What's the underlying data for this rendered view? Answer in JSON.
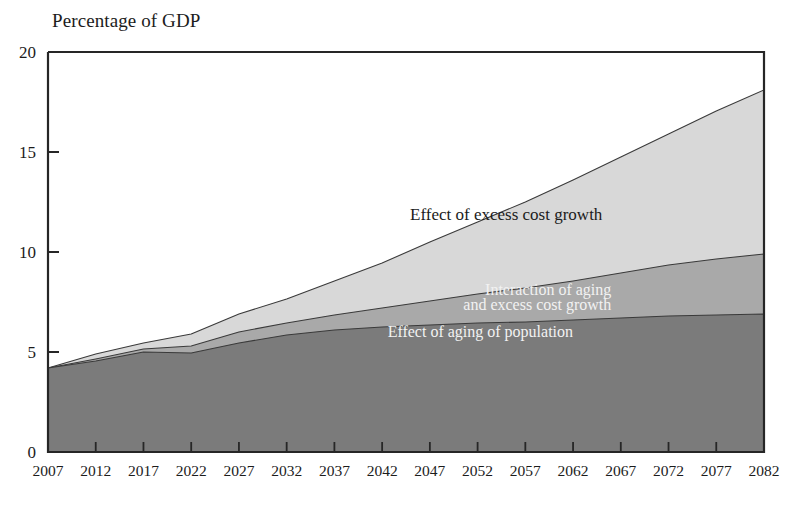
{
  "chart_data": {
    "type": "area",
    "title": "",
    "ylabel": "Percentage of GDP",
    "xlabel": "",
    "stacked": true,
    "grid": false,
    "legend_position": "inline-annotations",
    "xlim": [
      2007,
      2082
    ],
    "ylim": [
      0,
      20
    ],
    "ytick_labels": [
      "0",
      "5",
      "10",
      "15",
      "20"
    ],
    "ytick_values": [
      0,
      5,
      10,
      15,
      20
    ],
    "xtick_labels": [
      "2007",
      "2012",
      "2017",
      "2022",
      "2027",
      "2032",
      "2037",
      "2042",
      "2047",
      "2052",
      "2057",
      "2062",
      "2067",
      "2072",
      "2077",
      "2082"
    ],
    "xtick_values": [
      2007,
      2012,
      2017,
      2022,
      2027,
      2032,
      2037,
      2042,
      2047,
      2052,
      2057,
      2062,
      2067,
      2072,
      2077,
      2082
    ],
    "x": [
      2007,
      2012,
      2017,
      2022,
      2027,
      2032,
      2037,
      2042,
      2047,
      2052,
      2057,
      2062,
      2067,
      2072,
      2077,
      2082
    ],
    "series": [
      {
        "name": "Effect of aging of population",
        "color": "#7b7b7b",
        "values": [
          4.2,
          4.55,
          5.0,
          4.95,
          5.45,
          5.85,
          6.1,
          6.25,
          6.35,
          6.45,
          6.5,
          6.6,
          6.7,
          6.8,
          6.85,
          6.9
        ]
      },
      {
        "name": "Interaction of aging and excess cost growth",
        "color": "#a9a9a9",
        "values": [
          0.0,
          0.1,
          0.15,
          0.35,
          0.55,
          0.6,
          0.75,
          0.95,
          1.2,
          1.45,
          1.7,
          1.95,
          2.25,
          2.55,
          2.8,
          3.0
        ]
      },
      {
        "name": "Effect of excess cost growth",
        "color": "#d8d8d8",
        "values": [
          0.0,
          0.25,
          0.3,
          0.6,
          0.9,
          1.2,
          1.7,
          2.25,
          2.95,
          3.6,
          4.3,
          5.05,
          5.8,
          6.55,
          7.4,
          8.2
        ]
      }
    ],
    "cumulative_tops": {
      "aging": [
        4.2,
        4.55,
        5.0,
        4.95,
        5.45,
        5.85,
        6.1,
        6.25,
        6.35,
        6.45,
        6.5,
        6.6,
        6.7,
        6.8,
        6.85,
        6.9
      ],
      "aging_plus_interaction": [
        4.2,
        4.65,
        5.15,
        5.3,
        6.0,
        6.45,
        6.85,
        7.2,
        7.55,
        7.9,
        8.2,
        8.55,
        8.95,
        9.35,
        9.65,
        9.9
      ],
      "total": [
        4.2,
        4.9,
        5.45,
        5.9,
        6.9,
        7.65,
        8.55,
        9.45,
        10.5,
        11.5,
        12.5,
        13.6,
        14.75,
        15.9,
        17.05,
        18.1
      ]
    },
    "annotations": [
      {
        "text": "Effect of excess cost growth",
        "x": 2055,
        "y": 11.6,
        "color": "#1b1b1b"
      },
      {
        "text": "Interaction of aging",
        "x": 2066,
        "y": 7.85,
        "color": "#f2f2f2"
      },
      {
        "text": "and excess cost growth",
        "x": 2066,
        "y": 7.1,
        "color": "#f2f2f2"
      },
      {
        "text": "Effect of aging of population",
        "x": 2062,
        "y": 5.75,
        "color": "#f2f2f2"
      }
    ],
    "colors": {
      "band_light": "#d8d8d8",
      "band_medium": "#a9a9a9",
      "band_dark": "#7b7b7b",
      "axis": "#262626",
      "background": "#ffffff"
    }
  }
}
